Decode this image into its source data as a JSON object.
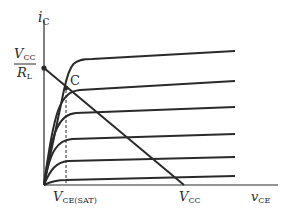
{
  "diagram": {
    "y_axis": {
      "label_main": "i",
      "label_sub": "C"
    },
    "x_axis": {
      "label_main": "v",
      "label_sub": "CE"
    },
    "y_intercept": {
      "numerator_main": "V",
      "numerator_sub": "CC",
      "denominator_main": "R",
      "denominator_sub": "L"
    },
    "x_intercept": {
      "label_main": "V",
      "label_sub": "CC"
    },
    "saturation_label": {
      "label_main": "V",
      "label_sub": "CE(SAT)"
    },
    "point_label": "C",
    "curve_count": 6,
    "colors": {
      "stroke": "#2a2a2a",
      "background": "#ffffff"
    }
  }
}
